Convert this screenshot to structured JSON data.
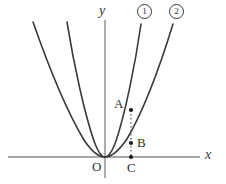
{
  "figure": {
    "background_color": "#ffffff",
    "axis_color": "#808080",
    "curve_color": "#3a3a3a",
    "point_color": "#1a1a1a",
    "dotted_line_color": "#555555",
    "axes": {
      "x_axis_label": "x",
      "y_axis_label": "y",
      "origin_label": "O",
      "x_axis_y_px": 157,
      "y_axis_x_px": 105,
      "x_axis_from_px": 8,
      "x_axis_to_px": 200,
      "y_axis_from_px": 20,
      "y_axis_to_px": 178
    },
    "curves": [
      {
        "id": "curve-1",
        "tag": "1",
        "tag_glyph": "①",
        "description": "narrower parabola, vertex at origin, opens upward",
        "vertex": [
          0,
          0
        ],
        "leading_coefficient_relative": "larger",
        "passes_through_point": "A"
      },
      {
        "id": "curve-2",
        "tag": "2",
        "tag_glyph": "②",
        "description": "wider parabola, vertex at origin, opens upward",
        "vertex": [
          0,
          0
        ],
        "leading_coefficient_relative": "smaller",
        "passes_through_point": "B"
      }
    ],
    "points": [
      {
        "id": "point-a",
        "label": "A",
        "on_curve": "curve-1",
        "px": [
          131,
          110
        ],
        "label_side": "left"
      },
      {
        "id": "point-b",
        "label": "B",
        "on_curve": "curve-2",
        "px": [
          131,
          143
        ],
        "label_side": "right"
      },
      {
        "id": "point-c",
        "label": "C",
        "on_curve": "x-axis",
        "px": [
          131,
          157
        ],
        "label_side": "below"
      }
    ],
    "connector": {
      "id": "dotted-segment-abc",
      "style": "dotted",
      "from_label": "A",
      "to_label": "C",
      "x_px": 131,
      "y_from_px": 110,
      "y_to_px": 157
    }
  }
}
